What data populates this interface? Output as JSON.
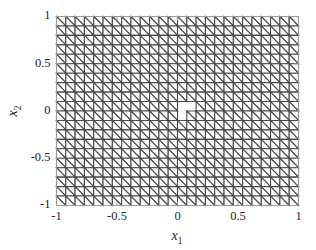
{
  "chart_data": {
    "type": "mesh",
    "title": "",
    "subtitle": "",
    "xlabel": "x",
    "xlabel_sub": "1",
    "ylabel": "x",
    "ylabel_sub": "2",
    "xlim": [
      -1,
      1
    ],
    "ylim": [
      -1,
      1
    ],
    "xticks": [
      -1,
      -0.5,
      0,
      0.5,
      1
    ],
    "xtick_labels": [
      "-1",
      "-0.5",
      "0",
      "0.5",
      "1"
    ],
    "yticks": [
      -1,
      -0.5,
      0,
      0.5,
      1
    ],
    "ytick_labels": [
      "-1",
      "-0.5",
      "0",
      "0.5",
      "1"
    ],
    "grid": false,
    "legend": null,
    "mesh": {
      "description": "Uniform triangular finite-element mesh over the square domain [-1,1] x [-1,1], each square cell split by a diagonal from its top-left to its bottom-right corner, with a small rhombus-shaped hole removed at the origin.",
      "nx": 26,
      "ny": 20,
      "diagonal_direction": "top-left-to-bottom-right",
      "edge_color": "#4a4a4a",
      "face_color": "#ffffff",
      "edge_width": 1.1,
      "hole": {
        "present": true,
        "center_x": 0.05,
        "center_y": 0.02,
        "width_cells": 2,
        "height_cells": 1.5,
        "shape": "rhombus"
      }
    },
    "axis_box_color": "#9a9a9a",
    "tick_color": "#9a9a9a",
    "background_color": "#ffffff"
  },
  "figure": {
    "name": "triangular-mesh-plot",
    "background_color": "#ffffff"
  }
}
